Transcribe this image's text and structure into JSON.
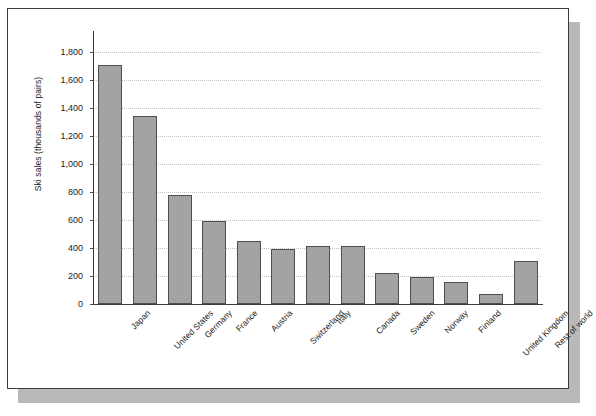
{
  "chart_data": {
    "type": "bar",
    "title": "",
    "xlabel": "",
    "ylabel": "Ski sales (thousands of pairs)",
    "ylim": [
      0,
      1800
    ],
    "ytick_labels": [
      "0",
      "200",
      "400",
      "600",
      "800",
      "1,000",
      "1,200",
      "1,400",
      "1,600",
      "1,800"
    ],
    "ytick_values": [
      0,
      200,
      400,
      600,
      800,
      1000,
      1200,
      1400,
      1600,
      1800
    ],
    "grid": "horizontal-dotted",
    "legend": "none",
    "bar_color": "#a3a3a3",
    "bar_border_color": "#4f4f4f",
    "gridline_color": "#c2c2c2",
    "axis_color": "#3a3a3a",
    "categories": [
      "Japan",
      "United States",
      "Germany",
      "France",
      "Austria",
      "Switzerland",
      "Italy",
      "Canada",
      "Sweden",
      "Norway",
      "Finland",
      "United Kingdom",
      "Rest of world"
    ],
    "values": [
      1710,
      1340,
      780,
      590,
      450,
      395,
      415,
      415,
      225,
      190,
      155,
      70,
      305
    ]
  },
  "card": {
    "background": "#ffffff",
    "border_color": "#3c3c3c",
    "shadow_color": "#b9b9b9"
  }
}
